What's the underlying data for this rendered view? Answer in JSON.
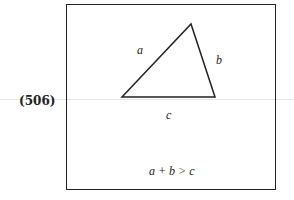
{
  "question": {
    "number": "(506)"
  },
  "figure": {
    "side_labels": {
      "a": "a",
      "b": "b",
      "c": "c"
    },
    "inequality": "a + b > c",
    "triangle_vertices": [
      [
        122,
        97
      ],
      [
        191,
        24
      ],
      [
        215,
        97
      ]
    ]
  }
}
